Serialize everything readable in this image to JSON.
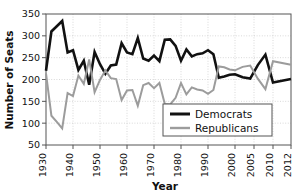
{
  "chart_data": {
    "type": "line",
    "title": "",
    "xlabel": "Year",
    "ylabel": "Number of Seats",
    "xlim": [
      1930,
      2012
    ],
    "ylim": [
      50,
      350
    ],
    "yticks": [
      50,
      100,
      150,
      200,
      250,
      300,
      350
    ],
    "xticks": [
      1930,
      1940,
      1950,
      1960,
      1970,
      1980,
      1990,
      2000,
      2005,
      2010,
      2012
    ],
    "xtick_labels": [
      "1930",
      "1940",
      "1950",
      "1960",
      "1970",
      "1980",
      "1990",
      "2000",
      "2005",
      "2010",
      "2012"
    ],
    "grid": true,
    "legend_position": "center-right",
    "x": [
      1930,
      1932,
      1934,
      1936,
      1938,
      1940,
      1942,
      1944,
      1946,
      1948,
      1950,
      1952,
      1954,
      1956,
      1958,
      1960,
      1962,
      1964,
      1966,
      1968,
      1970,
      1972,
      1974,
      1976,
      1978,
      1980,
      1982,
      1984,
      1986,
      1988,
      1990,
      1992,
      1994,
      1996,
      1998,
      2000,
      2002,
      2004,
      2006,
      2008,
      2010,
      2012
    ],
    "series": [
      {
        "name": "Democrats",
        "color": "#111111",
        "values": [
          220,
          310,
          322,
          334,
          262,
          267,
          222,
          243,
          188,
          263,
          235,
          213,
          232,
          234,
          283,
          262,
          258,
          295,
          248,
          243,
          255,
          242,
          291,
          292,
          277,
          243,
          269,
          253,
          258,
          260,
          267,
          258,
          204,
          207,
          211,
          212,
          205,
          202,
          233,
          257,
          193,
          201
        ]
      },
      {
        "name": "Republicans",
        "color": "#9c9c9c",
        "values": [
          214,
          117,
          103,
          88,
          169,
          162,
          209,
          190,
          246,
          171,
          199,
          221,
          203,
          201,
          153,
          175,
          176,
          140,
          187,
          192,
          180,
          192,
          144,
          143,
          158,
          192,
          166,
          182,
          177,
          175,
          167,
          176,
          230,
          228,
          223,
          221,
          229,
          232,
          202,
          178,
          242,
          234
        ]
      }
    ],
    "legend": [
      {
        "label": "Democrats",
        "color": "#111111",
        "line_width": 3
      },
      {
        "label": "Republicans",
        "color": "#9c9c9c",
        "line_width": 2.4
      }
    ]
  }
}
